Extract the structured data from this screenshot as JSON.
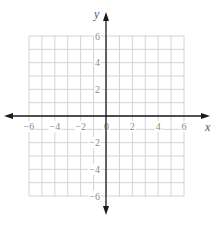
{
  "chart_data": {
    "type": "coordinate-grid",
    "title": "",
    "xlabel": "x",
    "ylabel": "y",
    "xlim": [
      -6,
      6
    ],
    "ylim": [
      -6,
      6
    ],
    "grid": true,
    "grid_step": 1,
    "x_ticks": [
      -6,
      -4,
      -2,
      0,
      2,
      4,
      6
    ],
    "y_ticks": [
      -6,
      -4,
      -2,
      2,
      4,
      6
    ],
    "x_tick_labels": [
      "−6",
      "−4",
      "−2",
      "0",
      "2",
      "4",
      "6"
    ],
    "y_tick_labels": [
      "−6",
      "−4",
      "−2",
      "2",
      "4",
      "6"
    ],
    "axes_arrows": true,
    "series": []
  },
  "colors": {
    "grid": "#d4d4d4",
    "axis": "#1a1a1a",
    "tick_label": "#8a8a8a",
    "background": "#ffffff"
  },
  "layout": {
    "grid_left": 29,
    "grid_right": 184,
    "grid_top": 36,
    "grid_bottom": 196,
    "origin_x": 106,
    "origin_y": 116,
    "x_arrow_left": 4,
    "x_arrow_right": 210,
    "y_arrow_top": 12,
    "y_arrow_bottom": 215
  }
}
